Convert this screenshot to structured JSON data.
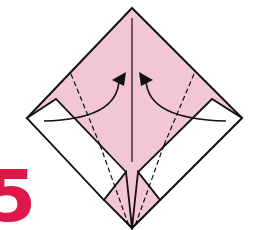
{
  "diagram": {
    "type": "origami-step",
    "step_number": "5",
    "colors": {
      "paper_colored": "#f2c6d2",
      "paper_white": "#ffffff",
      "line": "#111111",
      "step_number": "#e0174a"
    },
    "shapes": {
      "outer_square": "132,8 242,118 132,228 27,118",
      "left_white_flap": "27,118 56,99 126,172 104,200",
      "right_white_flap": "242,118 212,99 138,172 160,200",
      "bottom_pink_left": "104,200 126,172 132,228",
      "bottom_pink_right": "160,200 138,172 132,228",
      "center_crease": "132,18 132,162",
      "left_dash_upper": "71,74 100,145",
      "left_dash_lower": "100,145 129,226",
      "right_dash_upper": "194,74 164,145",
      "right_dash_lower": "164,145 135,226",
      "left_arrow_path": "M44,121 C90,120 118,108 119,80",
      "right_arrow_path": "M226,121 C178,120 147,108 146,80",
      "left_arrowhead": "112,80 126,72 124,86",
      "right_arrowhead": "153,80 139,72 141,86"
    },
    "annotations": [
      {
        "kind": "valley-fold-dashed",
        "side": "left"
      },
      {
        "kind": "valley-fold-dashed",
        "side": "right"
      },
      {
        "kind": "fold-arrow",
        "direction": "up-toward-center",
        "side": "left"
      },
      {
        "kind": "fold-arrow",
        "direction": "up-toward-center",
        "side": "right"
      }
    ]
  }
}
